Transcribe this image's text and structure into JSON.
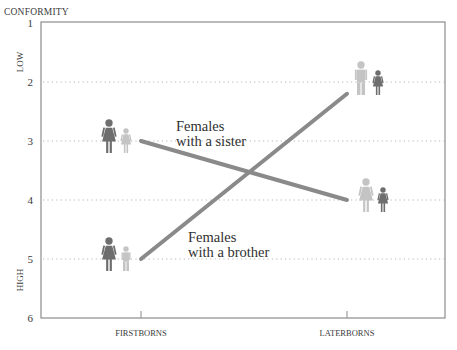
{
  "chart_data": {
    "type": "line",
    "title": "",
    "ylabel": "CONFORMITY",
    "ylabel_low": "LOW",
    "ylabel_high": "HIGH",
    "xlabel": "",
    "categories": [
      "FIRSTBORNS",
      "LATERBORNS"
    ],
    "yticks": [
      1,
      2,
      3,
      4,
      5,
      6
    ],
    "ylim": [
      1,
      6
    ],
    "y_inverted": true,
    "grid": "dotted horizontal at 2, 3, 4, 5",
    "legend": "inline annotations",
    "series": [
      {
        "name": "Females with a sister",
        "label_line1": "Females",
        "label_line2": "with a sister",
        "values": [
          3,
          4
        ],
        "icons": [
          {
            "big": "female-dark",
            "small": "female-light"
          },
          {
            "big": "female-light",
            "small": "female-dark"
          }
        ]
      },
      {
        "name": "Females with a brother",
        "label_line1": "Females",
        "label_line2": "with a brother",
        "values": [
          5,
          2.2
        ],
        "icons": [
          {
            "big": "female-dark",
            "small": "male-light"
          },
          {
            "big": "male-light",
            "small": "female-dark"
          }
        ]
      }
    ],
    "colors": {
      "line": "#8a8a8a",
      "figure_dark": "#6e6e6e",
      "figure_light": "#c4c4c4",
      "axis": "#8c8c8c",
      "grid": "#b0b0b0",
      "text": "#3a3a3a"
    }
  }
}
